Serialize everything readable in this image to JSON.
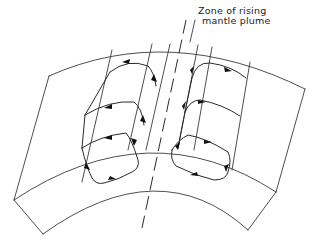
{
  "figure": {
    "annotation": {
      "line1": "Zone of rising",
      "line2": "mantle plume"
    },
    "elements": {
      "mantle_shell_segment": "curved slab (cross-section of mantle shell)",
      "plume_zone": "dashed central axis",
      "convection_cells_left": 3,
      "convection_cells_right": 3
    },
    "colors": {
      "line": "#3a3a3a",
      "arrow": "#111111",
      "background": "#ffffff"
    }
  }
}
